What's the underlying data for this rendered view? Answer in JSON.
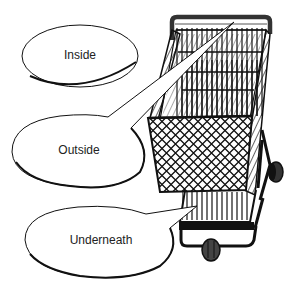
{
  "figure": {
    "bubbles": [
      {
        "label": "Inside",
        "cx": 80,
        "cy": 55
      },
      {
        "label": "Outside",
        "cx": 79,
        "cy": 150
      },
      {
        "label": "Underneath",
        "cx": 101,
        "cy": 240
      }
    ]
  },
  "colors": {
    "background": "#ffffff",
    "ink": "#111111",
    "text": "#222222"
  }
}
